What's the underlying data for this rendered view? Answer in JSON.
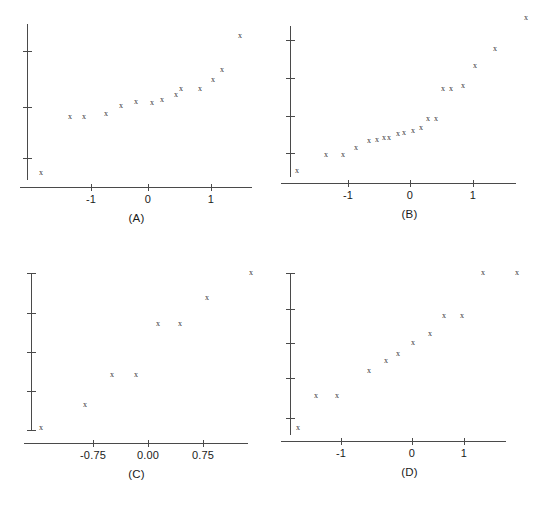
{
  "figure": {
    "width": 546,
    "height": 506,
    "background": "#ffffff",
    "marker_glyph": "x",
    "marker_color": "#333333",
    "axis_color": "#4a4a4a"
  },
  "chart_data": [
    {
      "type": "scatter",
      "title": "(A)",
      "xlabel": "",
      "ylabel": "",
      "grid": false,
      "legend": null,
      "xlim": [
        -1.85,
        1.75
      ],
      "ylim": [
        0.0,
        1.0
      ],
      "xticks": [
        -1,
        0,
        1
      ],
      "xticklabels": [
        "-1",
        "0",
        "1"
      ],
      "yticks_count": 3,
      "yticklabels": [],
      "n_points": 14,
      "x": [
        -1.78,
        -1.12,
        -0.8,
        -0.57,
        -0.36,
        -0.18,
        -0.02,
        0.15,
        0.33,
        0.52,
        0.78,
        1.02,
        1.28,
        1.52
      ],
      "y": [
        0.045,
        0.405,
        0.405,
        0.425,
        0.47,
        0.49,
        0.487,
        0.505,
        0.53,
        0.56,
        0.56,
        0.615,
        0.65,
        0.84
      ]
    },
    {
      "type": "scatter",
      "title": "(B)",
      "xlabel": "",
      "ylabel": "",
      "grid": false,
      "legend": null,
      "xlim": [
        -1.85,
        1.65
      ],
      "ylim": [
        0.0,
        1.0
      ],
      "xticks": [
        -1,
        0,
        1
      ],
      "xticklabels": [
        "-1",
        "0",
        "1"
      ],
      "yticks_count": 4,
      "yticklabels": [],
      "n_points": 20,
      "x": [
        -1.72,
        -1.3,
        -1.08,
        -0.82,
        -0.66,
        -0.55,
        -0.44,
        -0.34,
        -0.22,
        -0.12,
        -0.02,
        0.08,
        0.2,
        0.32,
        0.5,
        0.6,
        0.72,
        0.9,
        1.12,
        1.42
      ],
      "y": [
        0.075,
        0.175,
        0.175,
        0.215,
        0.25,
        0.255,
        0.27,
        0.268,
        0.29,
        0.292,
        0.305,
        0.32,
        0.35,
        0.35,
        0.455,
        0.455,
        0.47,
        0.53,
        0.58,
        0.69
      ]
    },
    {
      "type": "scatter",
      "title": "(C)",
      "xlabel": "",
      "ylabel": "",
      "grid": false,
      "legend": null,
      "xlim": [
        -1.2,
        1.15
      ],
      "ylim": [
        0.0,
        1.0
      ],
      "xticks": [
        -0.75,
        0.0,
        0.75
      ],
      "xticklabels": [
        "-0.75",
        "0.00",
        "0.75"
      ],
      "yticks_count": 5,
      "yticklabels": [],
      "n_points": 8,
      "x": [
        -1.12,
        -0.82,
        -0.52,
        -0.28,
        0.07,
        0.3,
        0.62,
        0.97
      ],
      "y": [
        0.05,
        0.16,
        0.29,
        0.288,
        0.56,
        0.56,
        0.7,
        0.875
      ]
    },
    {
      "type": "scatter",
      "title": "(D)",
      "xlabel": "",
      "ylabel": "",
      "grid": false,
      "legend": null,
      "xlim": [
        -1.7,
        1.5
      ],
      "ylim": [
        0.0,
        1.0
      ],
      "xticks": [
        -1,
        0,
        1
      ],
      "xticklabels": [
        "-1",
        "0",
        "1"
      ],
      "yticks_count": 5,
      "yticklabels": [],
      "n_points": 13,
      "x": [
        -1.62,
        -1.1,
        -0.85,
        -0.58,
        -0.4,
        -0.22,
        -0.02,
        0.15,
        0.38,
        0.6,
        0.82,
        1.05,
        1.42
      ],
      "y": [
        0.06,
        0.215,
        0.215,
        0.37,
        0.425,
        0.462,
        0.52,
        0.57,
        0.665,
        0.665,
        0.8,
        0.8,
        0.8
      ]
    }
  ],
  "panels": [
    {
      "name": "panel-a",
      "label": "(A)",
      "left": 0,
      "top": 0,
      "axis": {
        "y_x": 27,
        "y_top": 24,
        "y_bottom": 180,
        "x_left": 20,
        "x_right": 252,
        "x_y": 187
      },
      "yticks": [
        51,
        107,
        158
      ],
      "xticks": [
        {
          "px": 91,
          "label": "-1"
        },
        {
          "px": 148,
          "label": "0"
        },
        {
          "px": 211,
          "label": "1"
        }
      ],
      "points": [
        {
          "px": 41,
          "py": 173
        },
        {
          "px": 70,
          "py": 117
        },
        {
          "px": 84,
          "py": 117
        },
        {
          "px": 106,
          "py": 114
        },
        {
          "px": 121,
          "py": 106
        },
        {
          "px": 136,
          "py": 102
        },
        {
          "px": 152,
          "py": 103
        },
        {
          "px": 162,
          "py": 100
        },
        {
          "px": 176,
          "py": 95
        },
        {
          "px": 181,
          "py": 89
        },
        {
          "px": 200,
          "py": 89
        },
        {
          "px": 213,
          "py": 80
        },
        {
          "px": 222,
          "py": 70
        },
        {
          "px": 240,
          "py": 36
        }
      ]
    },
    {
      "name": "panel-b",
      "label": "(B)",
      "left": 273,
      "top": 0,
      "axis": {
        "y_x": 17,
        "y_top": 26,
        "y_bottom": 177,
        "x_left": 8,
        "x_right": 243,
        "x_y": 183
      },
      "yticks": [
        40,
        78,
        116,
        153
      ],
      "xticks": [
        {
          "px": 75,
          "label": "-1"
        },
        {
          "px": 137,
          "label": "0"
        },
        {
          "px": 200,
          "label": "1"
        }
      ],
      "points": [
        {
          "px": 24,
          "py": 171
        },
        {
          "px": 53,
          "py": 155
        },
        {
          "px": 70,
          "py": 155
        },
        {
          "px": 83,
          "py": 148
        },
        {
          "px": 96,
          "py": 141
        },
        {
          "px": 104,
          "py": 140
        },
        {
          "px": 111,
          "py": 138
        },
        {
          "px": 116,
          "py": 138
        },
        {
          "px": 125,
          "py": 134
        },
        {
          "px": 131,
          "py": 133
        },
        {
          "px": 140,
          "py": 131
        },
        {
          "px": 148,
          "py": 128
        },
        {
          "px": 155,
          "py": 119
        },
        {
          "px": 163,
          "py": 119
        },
        {
          "px": 170,
          "py": 89
        },
        {
          "px": 178,
          "py": 89
        },
        {
          "px": 190,
          "py": 86
        },
        {
          "px": 202,
          "py": 66
        },
        {
          "px": 222,
          "py": 49
        },
        {
          "px": 253,
          "py": 18
        }
      ]
    },
    {
      "name": "panel-c",
      "label": "(C)",
      "left": 0,
      "top": 253,
      "axis": {
        "y_x": 31,
        "y_top": 20,
        "y_bottom": 177,
        "x_left": 24,
        "x_right": 248,
        "x_y": 190
      },
      "yticks": [
        20,
        60,
        99,
        138,
        177
      ],
      "xticks": [
        {
          "px": 93,
          "label": "-0.75"
        },
        {
          "px": 148,
          "label": "0.00"
        },
        {
          "px": 203,
          "label": "0.75"
        }
      ],
      "points": [
        {
          "px": 41,
          "py": 175
        },
        {
          "px": 85,
          "py": 152
        },
        {
          "px": 112,
          "py": 122
        },
        {
          "px": 136,
          "py": 122
        },
        {
          "px": 158,
          "py": 71
        },
        {
          "px": 180,
          "py": 71
        },
        {
          "px": 207,
          "py": 45
        },
        {
          "px": 251,
          "py": 20
        }
      ]
    },
    {
      "name": "panel-d",
      "label": "(D)",
      "left": 273,
      "top": 253,
      "axis": {
        "y_x": 17,
        "y_top": 20,
        "y_bottom": 182,
        "x_left": 8,
        "x_right": 233,
        "x_y": 188
      },
      "yticks": [
        20,
        56,
        90,
        125,
        165
      ],
      "xticks": [
        {
          "px": 68,
          "label": "-1"
        },
        {
          "px": 139,
          "label": "0"
        },
        {
          "px": 191,
          "label": "1"
        }
      ],
      "points": [
        {
          "px": 25,
          "py": 175
        },
        {
          "px": 43,
          "py": 143
        },
        {
          "px": 64,
          "py": 143
        },
        {
          "px": 96,
          "py": 118
        },
        {
          "px": 113,
          "py": 108
        },
        {
          "px": 125,
          "py": 101
        },
        {
          "px": 140,
          "py": 90
        },
        {
          "px": 157,
          "py": 81
        },
        {
          "px": 171,
          "py": 63
        },
        {
          "px": 189,
          "py": 63
        },
        {
          "px": 210,
          "py": 20
        },
        {
          "px": 244,
          "py": 20
        }
      ]
    }
  ]
}
